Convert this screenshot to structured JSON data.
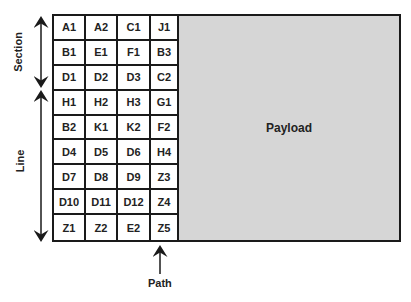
{
  "diagram": {
    "title": "",
    "grid": {
      "rows": [
        [
          "A1",
          "A2",
          "C1",
          "J1"
        ],
        [
          "B1",
          "E1",
          "F1",
          "B3"
        ],
        [
          "D1",
          "D2",
          "D3",
          "C2"
        ],
        [
          "H1",
          "H2",
          "H3",
          "G1"
        ],
        [
          "B2",
          "K1",
          "K2",
          "F2"
        ],
        [
          "D4",
          "D5",
          "D6",
          "H4"
        ],
        [
          "D7",
          "D8",
          "D9",
          "Z3"
        ],
        [
          "D10",
          "D11",
          "D12",
          "Z4"
        ],
        [
          "Z1",
          "Z2",
          "E2",
          "Z5"
        ]
      ]
    },
    "payload_label": "Payload",
    "section_label": "Section",
    "line_label": "Line",
    "path_label": "Path",
    "colors": {
      "payload_fill": "#d6d6d6",
      "border": "#1a1a1a",
      "text": "#222222"
    }
  }
}
